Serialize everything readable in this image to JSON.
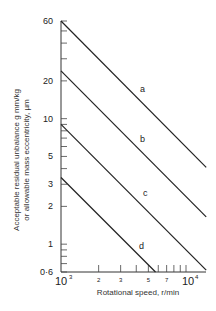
{
  "chart_data": {
    "type": "line",
    "title": "",
    "xlabel": "Rotational speed, r/min",
    "ylabel_line1": "Acceptable residual unbalance g mm/kg",
    "ylabel_line2": "or allowable mass eccentricity, µm",
    "xscale": "log",
    "yscale": "log",
    "xlim": [
      1000,
      14500
    ],
    "ylim": [
      0.6,
      60
    ],
    "grid": false,
    "legend": "inline labels",
    "x_ticks": [
      {
        "value": 1000,
        "label": "10³",
        "major": true
      },
      {
        "value": 2000,
        "label": "2"
      },
      {
        "value": 3000,
        "label": "3"
      },
      {
        "value": 4000,
        "label": ""
      },
      {
        "value": 5000,
        "label": "5"
      },
      {
        "value": 6000,
        "label": ""
      },
      {
        "value": 7000,
        "label": "7"
      },
      {
        "value": 8000,
        "label": ""
      },
      {
        "value": 9000,
        "label": ""
      },
      {
        "value": 10000,
        "label": "10⁴",
        "major": true
      }
    ],
    "y_ticks": [
      {
        "value": 60,
        "label": "60"
      },
      {
        "value": 50,
        "label": ""
      },
      {
        "value": 40,
        "label": ""
      },
      {
        "value": 30,
        "label": ""
      },
      {
        "value": 20,
        "label": "20"
      },
      {
        "value": 10,
        "label": "10"
      },
      {
        "value": 9,
        "label": ""
      },
      {
        "value": 8,
        "label": ""
      },
      {
        "value": 7,
        "label": ""
      },
      {
        "value": 6,
        "label": ""
      },
      {
        "value": 5,
        "label": "5"
      },
      {
        "value": 4,
        "label": ""
      },
      {
        "value": 3,
        "label": "3"
      },
      {
        "value": 2,
        "label": "2"
      },
      {
        "value": 1,
        "label": "1"
      },
      {
        "value": 0.9,
        "label": ""
      },
      {
        "value": 0.8,
        "label": ""
      },
      {
        "value": 0.7,
        "label": ""
      },
      {
        "value": 0.6,
        "label": "0·6"
      }
    ],
    "series": [
      {
        "name": "a",
        "x": [
          1000,
          14500
        ],
        "values": [
          60,
          4.1
        ]
      },
      {
        "name": "b",
        "x": [
          1000,
          14500
        ],
        "values": [
          24,
          1.65
        ]
      },
      {
        "name": "c",
        "x": [
          1000,
          14500
        ],
        "values": [
          9,
          0.62
        ]
      },
      {
        "name": "d",
        "x": [
          1000,
          5700
        ],
        "values": [
          3.4,
          0.6
        ]
      }
    ]
  }
}
